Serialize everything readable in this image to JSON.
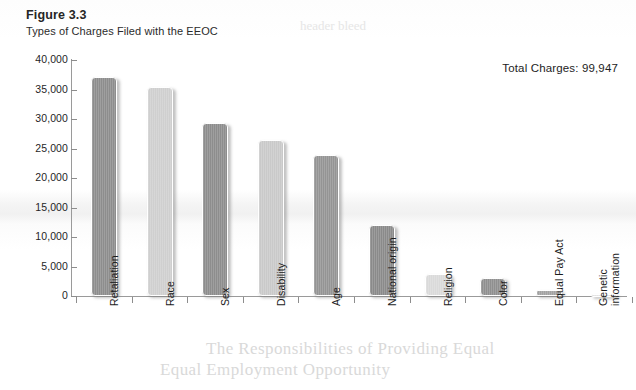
{
  "figure": {
    "number": "Figure 3.3",
    "title": "Types of Charges Filed with the EEOC",
    "total_label": "Total Charges: 99,947"
  },
  "bleed_through": {
    "line1": "The Responsibilities of Providing Equal",
    "line2": "Equal Employment Opportunity",
    "line3": "header bleed"
  },
  "chart_data": {
    "type": "bar",
    "title": "Types of Charges Filed with the EEOC",
    "subtitle": "Figure 3.3",
    "annotation": "Total Charges: 99,947",
    "xlabel": "",
    "ylabel": "",
    "ylim": [
      0,
      40000
    ],
    "ytick_values": [
      40000,
      35000,
      30000,
      25000,
      20000,
      15000,
      10000,
      5000,
      0
    ],
    "ytick_labels": [
      "40,000",
      "35,000",
      "30,000",
      "25,000",
      "20,000",
      "15,000",
      "10,000",
      "5,000",
      "0"
    ],
    "grid": false,
    "legend": "none",
    "categories": [
      "Retaliation",
      "Race",
      "Sex",
      "Disability",
      "Age",
      "National origin",
      "Religion",
      "Color",
      "Equal Pay Act",
      "Genetic information"
    ],
    "values": [
      37200,
      35400,
      29300,
      26500,
      23900,
      12100,
      3800,
      3000,
      1000,
      300
    ],
    "bar_colors": [
      "#8d8d8d",
      "#cfcfcf",
      "#8d8d8d",
      "#c9c9c9",
      "#949494",
      "#8a8a8a",
      "#dadada",
      "#8f8f8f",
      "#a2a2a2",
      "#e2e2e2"
    ]
  }
}
